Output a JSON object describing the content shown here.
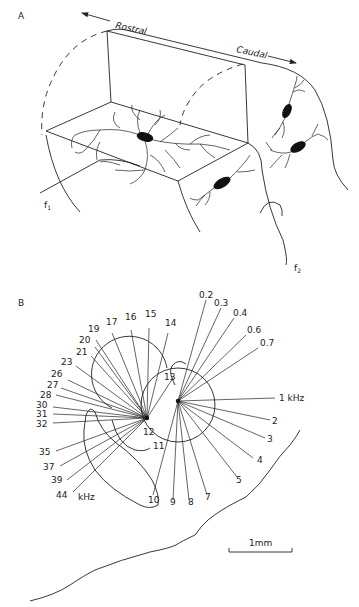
{
  "figure": {
    "panel_a": {
      "label": "A",
      "direction_left": "Rostral",
      "direction_right": "Caudal",
      "fiber_1": "f",
      "fiber_1_sub": "1",
      "fiber_2": "f",
      "fiber_2_sub": "2"
    },
    "panel_b": {
      "label": "B",
      "unit": "kHz",
      "scale_bar": "1mm",
      "left_fan_labels": [
        {
          "text": "12",
          "x": 143,
          "y": 435
        },
        {
          "text": "11",
          "x": 153,
          "y": 449
        },
        {
          "text": "13",
          "x": 164,
          "y": 380
        },
        {
          "text": "14",
          "x": 167,
          "y": 326
        },
        {
          "text": "15",
          "x": 146,
          "y": 317
        },
        {
          "text": "16",
          "x": 125,
          "y": 320
        },
        {
          "text": "17",
          "x": 106,
          "y": 325
        },
        {
          "text": "19",
          "x": 88,
          "y": 332
        },
        {
          "text": "20",
          "x": 79,
          "y": 342
        },
        {
          "text": "21",
          "x": 76,
          "y": 355
        },
        {
          "text": "23",
          "x": 62,
          "y": 365
        },
        {
          "text": "26",
          "x": 51,
          "y": 376
        },
        {
          "text": "27",
          "x": 47,
          "y": 387
        },
        {
          "text": "28",
          "x": 40,
          "y": 397
        },
        {
          "text": "30",
          "x": 36,
          "y": 407
        },
        {
          "text": "31",
          "x": 36,
          "y": 417
        },
        {
          "text": "32",
          "x": 36,
          "y": 427
        },
        {
          "text": "35",
          "x": 40,
          "y": 454
        },
        {
          "text": "37",
          "x": 43,
          "y": 469
        },
        {
          "text": "39",
          "x": 51,
          "y": 483
        },
        {
          "text": "44",
          "x": 56,
          "y": 498
        },
        {
          "text": "10",
          "x": 149,
          "y": 503
        },
        {
          "text": "9",
          "x": 170,
          "y": 505
        },
        {
          "text": "8",
          "x": 187,
          "y": 505
        }
      ],
      "right_fan_labels": [
        {
          "text": "0.2",
          "x": 201,
          "y": 297
        },
        {
          "text": "0.3",
          "x": 215,
          "y": 305
        },
        {
          "text": "0.4",
          "x": 234,
          "y": 315
        },
        {
          "text": "0.6",
          "x": 248,
          "y": 332
        },
        {
          "text": "0.7",
          "x": 261,
          "y": 345
        },
        {
          "text": "1 kHz",
          "x": 279,
          "y": 401
        },
        {
          "text": "2",
          "x": 273,
          "y": 423
        },
        {
          "text": "3",
          "x": 268,
          "y": 441
        },
        {
          "text": "4",
          "x": 258,
          "y": 462
        },
        {
          "text": "5",
          "x": 237,
          "y": 482
        },
        {
          "text": "7",
          "x": 206,
          "y": 500
        }
      ]
    }
  }
}
